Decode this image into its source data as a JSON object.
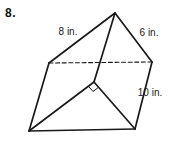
{
  "problem": {
    "number": "8."
  },
  "figure": {
    "type": "triangular-prism",
    "stroke_color": "#1a1a1a",
    "text_color": "#1a1a1a",
    "solid_width": 1.7,
    "dashed_width": 1.1,
    "dash_pattern": "4,2.6",
    "vertices": {
      "top_apex": [
        115,
        13
      ],
      "top_left": [
        49,
        63
      ],
      "top_right": [
        152,
        62
      ],
      "bottom_front": [
        94,
        82
      ],
      "bottom_left": [
        29,
        131
      ],
      "bottom_right": [
        135,
        129
      ]
    },
    "edges": [
      {
        "from": "top_left",
        "to": "top_right",
        "style": "dashed",
        "name": "top-back-hidden-edge"
      },
      {
        "from": "top_apex",
        "to": "top_left",
        "style": "solid",
        "name": "top-left-edge-8in"
      },
      {
        "from": "top_apex",
        "to": "top_right",
        "style": "solid",
        "name": "top-right-edge-6in"
      },
      {
        "from": "top_apex",
        "to": "bottom_front",
        "style": "solid",
        "name": "front-lateral-edge"
      },
      {
        "from": "top_left",
        "to": "bottom_left",
        "style": "solid",
        "name": "left-lateral-edge"
      },
      {
        "from": "top_right",
        "to": "bottom_right",
        "style": "solid",
        "name": "right-lateral-edge-10in"
      },
      {
        "from": "bottom_left",
        "to": "bottom_front",
        "style": "solid",
        "name": "base-left-leg"
      },
      {
        "from": "bottom_front",
        "to": "bottom_right",
        "style": "solid",
        "name": "base-right-leg"
      },
      {
        "from": "bottom_left",
        "to": "bottom_right",
        "style": "solid",
        "name": "base-bottom-edge"
      }
    ],
    "labels": [
      {
        "text": "8 in.",
        "x": 68,
        "y": 35,
        "name": "label-8-in"
      },
      {
        "text": "6 in.",
        "x": 149,
        "y": 36,
        "name": "label-6-in"
      },
      {
        "text": "10 in.",
        "x": 150,
        "y": 96,
        "name": "label-10-in"
      }
    ],
    "right_angle_marker": {
      "vertex": "bottom_front",
      "leg1": "bottom_left",
      "leg2": "bottom_right",
      "size": 7
    },
    "label_font_size": 10
  }
}
